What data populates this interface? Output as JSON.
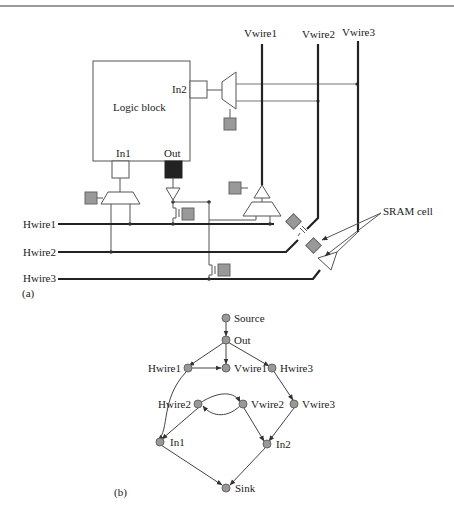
{
  "figure": {
    "part_a_label": "(a)",
    "part_b_label": "(b)",
    "logic_block": {
      "label": "Logic block",
      "pins": [
        "In1",
        "Out",
        "In2"
      ]
    },
    "vertical_wires": [
      "Vwire1",
      "Vwire2",
      "Vwire3"
    ],
    "horizontal_wires": [
      "Hwire1",
      "Hwire2",
      "Hwire3"
    ],
    "annotation": "SRAM cell",
    "graph": {
      "nodes": [
        {
          "id": "source",
          "label": "Source"
        },
        {
          "id": "out",
          "label": "Out"
        },
        {
          "id": "hwire1",
          "label": "Hwire1"
        },
        {
          "id": "vwire1",
          "label": "Vwire1"
        },
        {
          "id": "hwire3",
          "label": "Hwire3"
        },
        {
          "id": "hwire2",
          "label": "Hwire2"
        },
        {
          "id": "vwire2",
          "label": "Vwire2"
        },
        {
          "id": "vwire3",
          "label": "Vwire3"
        },
        {
          "id": "in1",
          "label": "In1"
        },
        {
          "id": "in2",
          "label": "In2"
        },
        {
          "id": "sink",
          "label": "Sink"
        }
      ],
      "edges": [
        [
          "source",
          "out"
        ],
        [
          "out",
          "hwire1"
        ],
        [
          "out",
          "vwire1"
        ],
        [
          "out",
          "hwire3"
        ],
        [
          "hwire1",
          "vwire1"
        ],
        [
          "hwire1",
          "in1"
        ],
        [
          "hwire3",
          "vwire3"
        ],
        [
          "hwire2",
          "vwire2"
        ],
        [
          "vwire2",
          "hwire2"
        ],
        [
          "hwire2",
          "in1"
        ],
        [
          "vwire2",
          "in2"
        ],
        [
          "vwire3",
          "in2"
        ],
        [
          "in1",
          "sink"
        ],
        [
          "in2",
          "sink"
        ]
      ]
    }
  }
}
